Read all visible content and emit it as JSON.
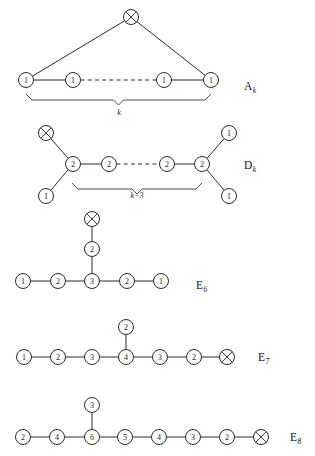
{
  "figure": {
    "width": 315,
    "height": 456,
    "background": "#ffffff",
    "ink_color": "#2b2b2b"
  },
  "diagrams": [
    {
      "id": "A",
      "name": "A",
      "subscript": "k",
      "label_x": 244,
      "label_y": 86,
      "brace": {
        "label": "k",
        "x1": 26,
        "x2": 211,
        "y": 94,
        "label_x": 119,
        "label_y": 115
      },
      "nodes": [
        {
          "id": "a-top",
          "x": 131,
          "y": 17,
          "label": "X",
          "type": "crossed"
        },
        {
          "id": "a-1",
          "x": 26,
          "y": 80,
          "label": "1",
          "type": "numbered"
        },
        {
          "id": "a-2",
          "x": 73,
          "y": 80,
          "label": "1",
          "type": "numbered"
        },
        {
          "id": "a-3",
          "x": 164,
          "y": 80,
          "label": "1",
          "type": "numbered"
        },
        {
          "id": "a-4",
          "x": 211,
          "y": 80,
          "label": "1",
          "type": "numbered"
        }
      ],
      "edges": [
        {
          "from": "a-top",
          "to": "a-1",
          "style": "solid"
        },
        {
          "from": "a-top",
          "to": "a-4",
          "style": "solid"
        },
        {
          "from": "a-1",
          "to": "a-2",
          "style": "solid"
        },
        {
          "from": "a-2",
          "to": "a-3",
          "style": "dashed"
        },
        {
          "from": "a-3",
          "to": "a-4",
          "style": "solid"
        }
      ]
    },
    {
      "id": "D",
      "name": "D",
      "subscript": "k",
      "label_x": 244,
      "label_y": 165,
      "brace": {
        "label": "k−3",
        "x1": 72,
        "x2": 202,
        "y": 183,
        "label_x": 137,
        "label_y": 198
      },
      "nodes": [
        {
          "id": "d-x",
          "x": 46,
          "y": 133,
          "label": "X",
          "type": "crossed"
        },
        {
          "id": "d-bl",
          "x": 46,
          "y": 196,
          "label": "1",
          "type": "numbered"
        },
        {
          "id": "d-c1",
          "x": 73,
          "y": 164,
          "label": "2",
          "type": "numbered"
        },
        {
          "id": "d-c2",
          "x": 109,
          "y": 164,
          "label": "2",
          "type": "numbered"
        },
        {
          "id": "d-c3",
          "x": 167,
          "y": 164,
          "label": "2",
          "type": "numbered"
        },
        {
          "id": "d-c4",
          "x": 202,
          "y": 164,
          "label": "2",
          "type": "numbered"
        },
        {
          "id": "d-tr",
          "x": 229,
          "y": 133,
          "label": "1",
          "type": "numbered"
        },
        {
          "id": "d-br",
          "x": 229,
          "y": 196,
          "label": "1",
          "type": "numbered"
        }
      ],
      "edges": [
        {
          "from": "d-x",
          "to": "d-c1",
          "style": "solid"
        },
        {
          "from": "d-bl",
          "to": "d-c1",
          "style": "solid"
        },
        {
          "from": "d-c1",
          "to": "d-c2",
          "style": "solid"
        },
        {
          "from": "d-c2",
          "to": "d-c3",
          "style": "dashed"
        },
        {
          "from": "d-c3",
          "to": "d-c4",
          "style": "solid"
        },
        {
          "from": "d-c4",
          "to": "d-tr",
          "style": "solid"
        },
        {
          "from": "d-c4",
          "to": "d-br",
          "style": "solid"
        }
      ]
    },
    {
      "id": "E6",
      "name": "E",
      "subscript": "6",
      "label_x": 196,
      "label_y": 285,
      "brace": null,
      "nodes": [
        {
          "id": "e6-x",
          "x": 92,
          "y": 219,
          "label": "X",
          "type": "crossed"
        },
        {
          "id": "e6-v",
          "x": 92,
          "y": 249,
          "label": "2",
          "type": "numbered"
        },
        {
          "id": "e6-1",
          "x": 23,
          "y": 281,
          "label": "1",
          "type": "numbered"
        },
        {
          "id": "e6-2",
          "x": 58,
          "y": 281,
          "label": "2",
          "type": "numbered"
        },
        {
          "id": "e6-3",
          "x": 92,
          "y": 281,
          "label": "3",
          "type": "numbered"
        },
        {
          "id": "e6-4",
          "x": 127,
          "y": 281,
          "label": "2",
          "type": "numbered"
        },
        {
          "id": "e6-5",
          "x": 161,
          "y": 281,
          "label": "1",
          "type": "numbered"
        }
      ],
      "edges": [
        {
          "from": "e6-x",
          "to": "e6-v",
          "style": "solid"
        },
        {
          "from": "e6-v",
          "to": "e6-3",
          "style": "solid"
        },
        {
          "from": "e6-1",
          "to": "e6-2",
          "style": "solid"
        },
        {
          "from": "e6-2",
          "to": "e6-3",
          "style": "solid"
        },
        {
          "from": "e6-3",
          "to": "e6-4",
          "style": "solid"
        },
        {
          "from": "e6-4",
          "to": "e6-5",
          "style": "solid"
        }
      ]
    },
    {
      "id": "E7",
      "name": "E",
      "subscript": "7",
      "label_x": 258,
      "label_y": 357,
      "brace": null,
      "nodes": [
        {
          "id": "e7-v",
          "x": 126,
          "y": 327,
          "label": "2",
          "type": "numbered"
        },
        {
          "id": "e7-1",
          "x": 24,
          "y": 357,
          "label": "1",
          "type": "numbered"
        },
        {
          "id": "e7-2",
          "x": 58,
          "y": 357,
          "label": "2",
          "type": "numbered"
        },
        {
          "id": "e7-3",
          "x": 92,
          "y": 357,
          "label": "3",
          "type": "numbered"
        },
        {
          "id": "e7-4",
          "x": 126,
          "y": 357,
          "label": "4",
          "type": "numbered"
        },
        {
          "id": "e7-5",
          "x": 160,
          "y": 357,
          "label": "3",
          "type": "numbered"
        },
        {
          "id": "e7-6",
          "x": 194,
          "y": 357,
          "label": "2",
          "type": "numbered"
        },
        {
          "id": "e7-x",
          "x": 227,
          "y": 357,
          "label": "X",
          "type": "crossed"
        }
      ],
      "edges": [
        {
          "from": "e7-v",
          "to": "e7-4",
          "style": "solid"
        },
        {
          "from": "e7-1",
          "to": "e7-2",
          "style": "solid"
        },
        {
          "from": "e7-2",
          "to": "e7-3",
          "style": "solid"
        },
        {
          "from": "e7-3",
          "to": "e7-4",
          "style": "solid"
        },
        {
          "from": "e7-4",
          "to": "e7-5",
          "style": "solid"
        },
        {
          "from": "e7-5",
          "to": "e7-6",
          "style": "solid"
        },
        {
          "from": "e7-6",
          "to": "e7-x",
          "style": "solid"
        }
      ]
    },
    {
      "id": "E8",
      "name": "E",
      "subscript": "8",
      "label_x": 290,
      "label_y": 437,
      "brace": null,
      "nodes": [
        {
          "id": "e8-v",
          "x": 92,
          "y": 405,
          "label": "3",
          "type": "numbered"
        },
        {
          "id": "e8-1",
          "x": 23,
          "y": 437,
          "label": "2",
          "type": "numbered"
        },
        {
          "id": "e8-2",
          "x": 57,
          "y": 437,
          "label": "4",
          "type": "numbered"
        },
        {
          "id": "e8-3",
          "x": 92,
          "y": 437,
          "label": "6",
          "type": "numbered"
        },
        {
          "id": "e8-4",
          "x": 125,
          "y": 437,
          "label": "5",
          "type": "numbered"
        },
        {
          "id": "e8-5",
          "x": 159,
          "y": 437,
          "label": "4",
          "type": "numbered"
        },
        {
          "id": "e8-6",
          "x": 193,
          "y": 437,
          "label": "3",
          "type": "numbered"
        },
        {
          "id": "e8-7",
          "x": 227,
          "y": 437,
          "label": "2",
          "type": "numbered"
        },
        {
          "id": "e8-x",
          "x": 261,
          "y": 437,
          "label": "X",
          "type": "crossed"
        }
      ],
      "edges": [
        {
          "from": "e8-v",
          "to": "e8-3",
          "style": "solid"
        },
        {
          "from": "e8-1",
          "to": "e8-2",
          "style": "solid"
        },
        {
          "from": "e8-2",
          "to": "e8-3",
          "style": "solid"
        },
        {
          "from": "e8-3",
          "to": "e8-4",
          "style": "solid"
        },
        {
          "from": "e8-4",
          "to": "e8-5",
          "style": "solid"
        },
        {
          "from": "e8-5",
          "to": "e8-6",
          "style": "solid"
        },
        {
          "from": "e8-6",
          "to": "e8-7",
          "style": "solid"
        },
        {
          "from": "e8-7",
          "to": "e8-x",
          "style": "solid"
        }
      ]
    }
  ],
  "node_radius": 7.5
}
